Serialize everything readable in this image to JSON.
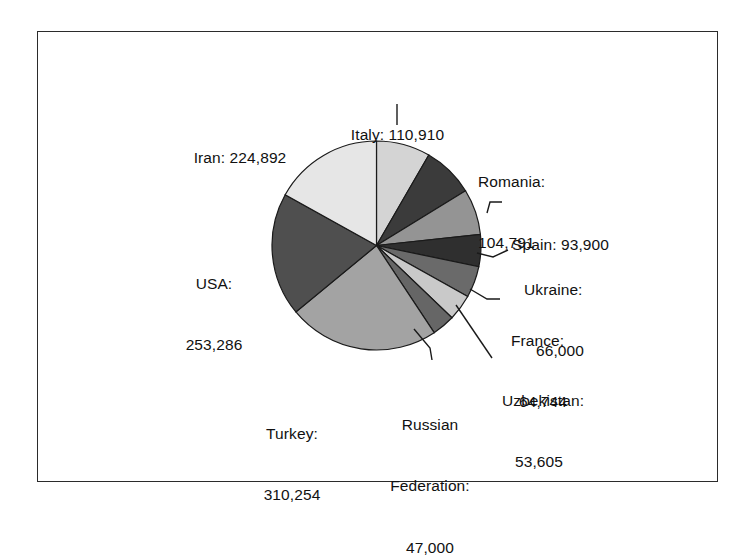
{
  "figure": {
    "background": "#ffffff",
    "border_color": "#2b2b2b"
  },
  "chart_data": {
    "type": "pie",
    "title": "",
    "subtitle": "",
    "xlabel": "",
    "ylabel": "",
    "legend_position": "none",
    "label_format": "{name}: {value}",
    "total": 1329382,
    "start_angle_deg": -90,
    "direction": "clockwise",
    "categories": [
      "Italy",
      "Romania",
      "Spain",
      "Ukraine",
      "France",
      "Uzbekistan",
      "Russian Federation",
      "Turkey",
      "USA",
      "Iran"
    ],
    "values": [
      110910,
      104791,
      93900,
      66000,
      64744,
      53605,
      47000,
      310254,
      253286,
      224892
    ],
    "value_labels": [
      "110,910",
      "104,791",
      "93,900",
      "66,000",
      "64,744",
      "53,605",
      "47,000",
      "310,254",
      "253,286",
      "224,892"
    ],
    "slice_colors": [
      "#d4d4d4",
      "#3b3b3b",
      "#949494",
      "#2f2f2f",
      "#6a6a6a",
      "#c9c9c9",
      "#666666",
      "#a3a3a3",
      "#4f4f4f",
      "#e6e6e6"
    ],
    "slices": [
      {
        "name": "Italy",
        "value": 110910,
        "value_label": "110,910",
        "label": "Italy: 110,910",
        "color": "#d4d4d4"
      },
      {
        "name": "Romania",
        "value": 104791,
        "value_label": "104,791",
        "label": "Romania: 104,791",
        "color": "#3b3b3b"
      },
      {
        "name": "Spain",
        "value": 93900,
        "value_label": "93,900",
        "label": "Spain: 93,900",
        "color": "#949494"
      },
      {
        "name": "Ukraine",
        "value": 66000,
        "value_label": "66,000",
        "label": "Ukraine: 66,000",
        "color": "#2f2f2f"
      },
      {
        "name": "France",
        "value": 64744,
        "value_label": "64,744",
        "label": "France: 64,744",
        "color": "#6a6a6a"
      },
      {
        "name": "Uzbekistan",
        "value": 53605,
        "value_label": "53,605",
        "label": "Uzbekistan: 53,605",
        "color": "#c9c9c9"
      },
      {
        "name": "Russian Federation",
        "value": 47000,
        "value_label": "47,000",
        "label": "Russian Federation: 47,000",
        "color": "#666666"
      },
      {
        "name": "Turkey",
        "value": 310254,
        "value_label": "310,254",
        "label": "Turkey: 310,254",
        "color": "#a3a3a3"
      },
      {
        "name": "USA",
        "value": 253286,
        "value_label": "253,286",
        "label": "USA: 253,286",
        "color": "#4f4f4f"
      },
      {
        "name": "Iran",
        "value": 224892,
        "value_label": "224,892",
        "label": "Iran: 224,892",
        "color": "#e6e6e6"
      }
    ]
  },
  "labels": {
    "italy_line1": "Italy: 110,910",
    "romania_line1": "Romania:",
    "romania_line2": "104,791",
    "spain_line1": "Spain: 93,900",
    "ukraine_line1": "Ukraine:",
    "ukraine_line2": "66,000",
    "france_line1": "France:",
    "france_line2": "64,744",
    "uzbekistan_line1": "Uzbekistan:",
    "uzbekistan_line2": "53,605",
    "russia_line1": "Russian",
    "russia_line2": "Federation:",
    "russia_line3": "47,000",
    "turkey_line1": "Turkey:",
    "turkey_line2": "310,254",
    "usa_line1": "USA:",
    "usa_line2": "253,286",
    "iran_line1": "Iran: 224,892"
  }
}
